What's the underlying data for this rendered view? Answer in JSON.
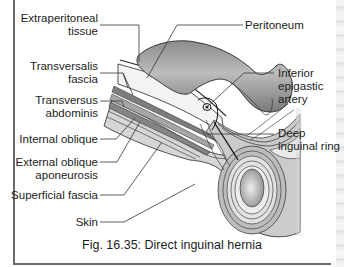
{
  "figure": {
    "caption": "Fig. 16.35:  Direct inguinal hernia",
    "title": "Direct inguinal hernia",
    "figure_number": "16.35"
  },
  "labels": {
    "left": [
      {
        "line1": "Extraperitoneal",
        "line2": "tissue"
      },
      {
        "line1": "Transversalis",
        "line2": "fascia"
      },
      {
        "line1": "Transversus",
        "line2": "abdominis"
      },
      {
        "line1": "Internal oblique",
        "line2": ""
      },
      {
        "line1": "External oblique",
        "line2": "aponeurosis"
      },
      {
        "line1": "Superficial fascia",
        "line2": ""
      },
      {
        "line1": "Skin",
        "line2": ""
      }
    ],
    "right": [
      {
        "line1": "Peritoneum",
        "line2": "",
        "line3": ""
      },
      {
        "line1": "Inferior",
        "line2": "epigastic",
        "line3": "artery"
      },
      {
        "line1": "Deep",
        "line2": "inguinal ring",
        "line3": ""
      }
    ]
  },
  "colors": {
    "frame": "#6a6a6a",
    "tissue_light": "#d4d4d4",
    "tissue_mid": "#b8b8b8",
    "tissue_dark": "#8a8a8a",
    "hernia_sac": "#a0a0a0",
    "leader_line": "#333333"
  }
}
